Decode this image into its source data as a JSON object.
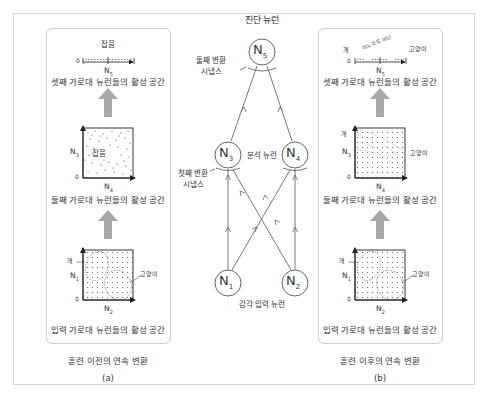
{
  "title": "진단 뉴런",
  "network": {
    "neurons": {
      "n1": {
        "label": "N",
        "sub": "1"
      },
      "n2": {
        "label": "N",
        "sub": "2"
      },
      "n3": {
        "label": "N",
        "sub": "3"
      },
      "n4": {
        "label": "N",
        "sub": "4"
      },
      "n5": {
        "label": "N",
        "sub": "5"
      }
    },
    "labels": {
      "second_synapse_line1": "둘째 변환",
      "second_synapse_line2": "시냅스",
      "analysis_neurons": "분석 뉴런",
      "first_synapse_line1": "첫째 변환",
      "first_synapse_line2": "시냅스",
      "sensory_input": "감각 입력 뉴런"
    }
  },
  "panel_a": {
    "caption": "훈련 이전의 연속 변환",
    "tag": "(a)",
    "third_layer": {
      "top_label": "잡음",
      "zero": "0",
      "axis": "N",
      "axis_sub": "5",
      "title": "셋째 가로대 뉴런들의 활성 공간"
    },
    "second_layer": {
      "center_label": "잡음",
      "y_axis": "N",
      "y_sub": "3",
      "x_axis": "N",
      "x_sub": "4",
      "zero": "0",
      "title": "둘째 가로대 뉴런들의 활성 공간"
    },
    "input_layer": {
      "dog_label": "개",
      "cat_label": "고양이",
      "y_axis": "N",
      "y_sub": "1",
      "x_axis": "N",
      "x_sub": "2",
      "zero": "0",
      "title": "입력 가로대 뉴런들의 활성 공간"
    }
  },
  "panel_b": {
    "caption": "훈련 이후의 연속 변환",
    "tag": "(b)",
    "third_layer": {
      "dog_label": "개",
      "neither_label": "어느것도 아닌",
      "cat_label": "고양이",
      "zero": "0",
      "axis": "N",
      "axis_sub": "5",
      "title": "셋째 가로대 뉴런들의 활성 공간"
    },
    "second_layer": {
      "dog_label": "개",
      "cat_label": "고양이",
      "y_axis": "N",
      "y_sub": "3",
      "x_axis": "N",
      "x_sub": "4",
      "zero": "0",
      "title": "둘째 가로대 뉴런들의 활성 공간"
    },
    "input_layer": {
      "dog_label": "개",
      "cat_label": "고양이",
      "y_axis": "N",
      "y_sub": "1",
      "x_axis": "N",
      "x_sub": "2",
      "zero": "0",
      "title": "입력 가로대 뉴런들의 활성 공간"
    }
  },
  "colors": {
    "line": "#555555",
    "arrow_fill": "#a8a8a8",
    "panel_border": "#cfcfcf",
    "frame_border": "#d8d8d8"
  }
}
